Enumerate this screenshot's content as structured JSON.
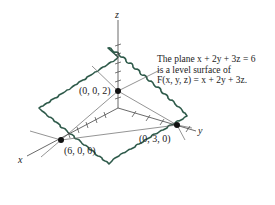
{
  "figure": {
    "caption": {
      "line1": "The plane x + 2y + 3z = 6",
      "line2": "is a level surface of",
      "line3": "F(x, y, z) = x + 2y + 3z."
    },
    "axes": {
      "x_label": "x",
      "y_label": "y",
      "z_label": "z"
    },
    "points": [
      {
        "label": "(0, 0, 2)"
      },
      {
        "label": "(6, 0, 0)"
      },
      {
        "label": "(0, 3, 0)"
      }
    ],
    "colors": {
      "plane_outline": "#2e5a4a",
      "axes": "#555555",
      "points": "#111111"
    }
  }
}
